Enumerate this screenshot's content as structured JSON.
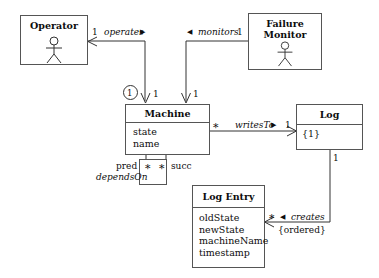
{
  "diagram": {
    "classes": [
      {
        "id": "operator",
        "name": "Operator",
        "kind": "actor-class",
        "attributes": []
      },
      {
        "id": "failure-monitor",
        "name": "Failure\nMonitor",
        "name_line1": "Failure",
        "name_line2": "Monitor",
        "kind": "actor-class",
        "attributes": []
      },
      {
        "id": "machine",
        "name": "Machine",
        "kind": "class",
        "attributes": [
          "state",
          "name"
        ]
      },
      {
        "id": "log",
        "name": "Log",
        "kind": "class",
        "attributes": [
          "{1}"
        ]
      },
      {
        "id": "log-entry",
        "name": "Log Entry",
        "kind": "class",
        "attributes": [
          "oldState",
          "newState",
          "machineName",
          "timestamp"
        ]
      }
    ],
    "associations": [
      {
        "id": "operates",
        "label": "operates",
        "direction_marker": "▶",
        "source_multiplicity": "1",
        "target_multiplicity": "1",
        "qualifier": "①"
      },
      {
        "id": "monitors",
        "label": "monitors",
        "direction_marker": "◀",
        "source_multiplicity": "1",
        "target_multiplicity": "1"
      },
      {
        "id": "writes-to",
        "label": "writesTo",
        "direction_marker": "▶",
        "source_multiplicity": "*",
        "target_multiplicity": "1"
      },
      {
        "id": "creates",
        "label": "creates",
        "direction_marker": "◀",
        "source_multiplicity": "1",
        "target_multiplicity": "*",
        "constraint": "{ordered}"
      },
      {
        "id": "depends-on",
        "label": "dependsOn",
        "role_source": "pred",
        "role_target": "succ",
        "source_multiplicity": "*",
        "target_multiplicity": "*"
      }
    ]
  },
  "colors": {
    "stroke": "#555555",
    "line": "#333333",
    "text": "#0d0d0d",
    "background": "#ffffff"
  }
}
